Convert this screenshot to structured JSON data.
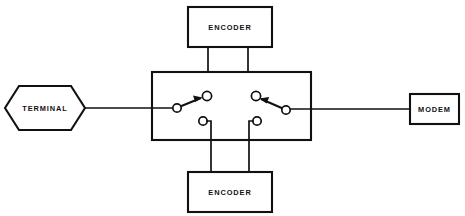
{
  "diagram": {
    "background_color": "#ffffff",
    "line_color": "#111111",
    "fill_color": "#ffffff"
  },
  "nodes": {
    "terminal": {
      "label": "TERMINAL",
      "shape": "hexagon",
      "x": 5,
      "y": 86,
      "width": 80,
      "height": 44,
      "cx": 45,
      "cy": 108
    },
    "modem": {
      "label": "MODEM",
      "shape": "rectangle",
      "x": 410,
      "y": 94,
      "width": 49,
      "height": 30,
      "cx": 434.5,
      "cy": 109
    },
    "encoder_top": {
      "label": "ENCODER",
      "shape": "rectangle",
      "x": 188,
      "y": 7,
      "width": 84,
      "height": 40,
      "cx": 230,
      "cy": 27
    },
    "encoder_bottom": {
      "label": "ENCODER",
      "shape": "rectangle",
      "x": 188,
      "y": 172,
      "width": 84,
      "height": 40,
      "cx": 230,
      "cy": 192
    },
    "switch_box": {
      "label": "",
      "shape": "rectangle",
      "x": 152,
      "y": 72,
      "width": 159,
      "height": 68
    }
  },
  "switches": {
    "left": {
      "name": "left-transfer-switch",
      "pivot": {
        "cx": 177,
        "cy": 108,
        "r": 4.2
      },
      "contact_upper": {
        "cx": 207,
        "cy": 96,
        "r": 4.6
      },
      "contact_lower": {
        "cx": 203,
        "cy": 121,
        "r": 4.2
      },
      "throw_direction": "up-right",
      "arrow": "toward-upper-contact",
      "connected_to": "encoder_top"
    },
    "right": {
      "name": "right-transfer-switch",
      "pivot": {
        "cx": 286,
        "cy": 110,
        "r": 4.2
      },
      "contact_upper": {
        "cx": 256,
        "cy": 96,
        "r": 4.6
      },
      "contact_lower": {
        "cx": 257,
        "cy": 121,
        "r": 4.2
      },
      "throw_direction": "up-left",
      "arrow": "toward-upper-contact",
      "connected_to": "encoder_top"
    }
  },
  "wires": {
    "terminal_to_switch": {
      "name": "terminal-to-switchbox-line",
      "from": [
        85,
        108
      ],
      "to": [
        173,
        108
      ]
    },
    "modem_to_switch": {
      "name": "modem-to-switchbox-line",
      "from": [
        410,
        109
      ],
      "to": [
        290,
        109
      ]
    },
    "encoder_top_left_drop": {
      "name": "encoder-top-left-drop",
      "x": 208,
      "from_y": 47,
      "to_y": 96
    },
    "encoder_top_right_drop": {
      "name": "encoder-top-right-drop",
      "x": 248,
      "from_y": 47,
      "to_y": 96
    },
    "encoder_bottom_left_riser": {
      "name": "encoder-bottom-left-riser",
      "x": 211,
      "from_y": 172,
      "to_y": 121
    },
    "encoder_bottom_right_riser": {
      "name": "encoder-bottom-right-riser",
      "x": 249,
      "from_y": 172,
      "to_y": 121
    }
  }
}
